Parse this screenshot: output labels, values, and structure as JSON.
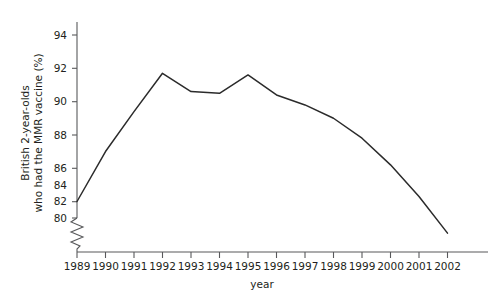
{
  "chart_data": {
    "type": "line",
    "title": "",
    "subtitle": "",
    "xlabel": "year",
    "ylabel": "British 2-year-olds\nwho had the MMR vaccine (%)",
    "ylabel_line1": "British 2-year-olds",
    "ylabel_line2": "who had the MMR vaccine (%)",
    "categories": [
      "1989",
      "1990",
      "1991",
      "1992",
      "1993",
      "1994",
      "1995",
      "1996",
      "1997",
      "1998",
      "1999",
      "2000",
      "2001",
      "2002"
    ],
    "x": [
      1989,
      1990,
      1991,
      1992,
      1993,
      1994,
      1995,
      1996,
      1997,
      1998,
      1999,
      2000,
      2001,
      2002
    ],
    "values": [
      84.0,
      87.0,
      89.4,
      91.7,
      90.6,
      90.5,
      91.6,
      90.4,
      89.8,
      89.0,
      87.8,
      86.2,
      84.3,
      82.1
    ],
    "series": [
      {
        "name": "MMR vaccine uptake",
        "color": "#2b2b2b",
        "values": [
          84.0,
          87.0,
          89.4,
          91.7,
          90.6,
          90.5,
          91.6,
          90.4,
          89.8,
          89.0,
          87.8,
          86.2,
          84.3,
          82.1
        ]
      }
    ],
    "ytick_labels": [
      "94",
      "92",
      "90",
      "88",
      "86",
      "84",
      "82",
      "80"
    ],
    "yticks": [
      94,
      92,
      90,
      88,
      86,
      84,
      82,
      80
    ],
    "ylim": [
      80,
      95.5
    ],
    "xlim": [
      1989,
      2002.6
    ],
    "y_axis_break": true,
    "y_axis_break_symbol": "zigzag",
    "grid": false,
    "legend": false,
    "legend_position": "none",
    "markers": false,
    "axis_color": "#58595b",
    "line_color": "#2b2b2b",
    "background_color": "#ffffff"
  }
}
